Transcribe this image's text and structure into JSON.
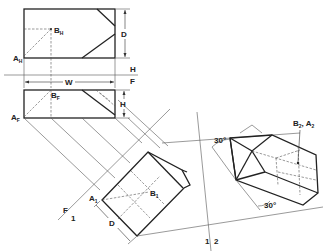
{
  "diagram": {
    "type": "orthographic-auxiliary-projection",
    "views": [
      "top",
      "front",
      "auxiliary-1",
      "auxiliary-2"
    ],
    "labels": {
      "a_top": "A",
      "a_top_sub": "H",
      "b_top": "B",
      "b_top_sub": "H",
      "a_front": "A",
      "a_front_sub": "F",
      "b_front": "B",
      "b_front_sub": "F",
      "a_aux1": "A",
      "a_aux1_sub": "1",
      "b_aux1": "B",
      "b_aux1_sub": "1",
      "b2a2": "B",
      "b2a2_sub1": "2",
      "b2a2_sep": ", A",
      "b2a2_sub2": "2"
    },
    "dimensions": {
      "depth": "D",
      "width": "W",
      "height": "H",
      "depth_aux": "D"
    },
    "fold_lines": {
      "hf_top": "H",
      "hf_bottom": "F",
      "f1_left": "F",
      "f1_right": "1",
      "l12_left": "1",
      "l12_right": "2"
    },
    "angles": {
      "upper": "30°",
      "lower": "30°"
    }
  }
}
